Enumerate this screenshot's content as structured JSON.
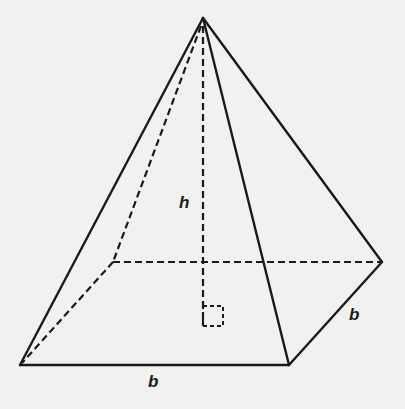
{
  "diagram": {
    "labels": {
      "height": "h",
      "base_front": "b",
      "base_side": "b"
    },
    "colors": {
      "background": "#f1f1ef",
      "stroke": "#1a1a1a"
    },
    "vertices": {
      "apex": [
        203,
        18
      ],
      "front_left": [
        20,
        365
      ],
      "front_right": [
        289,
        365
      ],
      "back_right": [
        382,
        262
      ],
      "back_left": [
        113,
        262
      ],
      "height_foot": [
        203,
        326
      ]
    }
  }
}
